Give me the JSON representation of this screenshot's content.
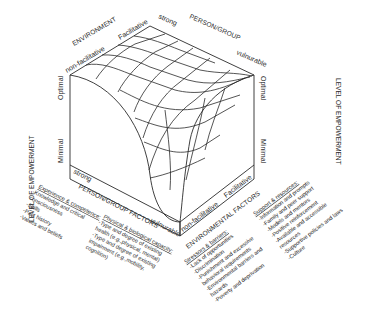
{
  "diagram": {
    "top_axes": {
      "environment": {
        "title": "ENVIRONMENT",
        "low": "non-facilitative",
        "high": "Facilitative"
      },
      "person_group": {
        "title": "PERSON/GROUP",
        "high": "strong",
        "low": "vulnurable"
      }
    },
    "vertical_axes": {
      "left": {
        "title": "LEVEL OF EMPOWERMENT",
        "high": "Optimal",
        "low": "Minimal"
      },
      "right": {
        "title": "LEVEL OF EMPOWERMENT",
        "high": "Optimal",
        "low": "Minimal"
      }
    },
    "base_axes": {
      "person_group_factors": {
        "title": "PERSON/GROUP FACTORS",
        "start": "strong",
        "end": "vulnurable"
      },
      "environmental_factors": {
        "title": "ENVIRONMENTAL FACTORS",
        "start": "non-facilitative",
        "end": "Facilitative"
      }
    },
    "factor_lists": {
      "experience": {
        "header": "Experience & competence:",
        "items": [
          "-Knowledge and critical",
          "consciousness",
          "-Skills",
          "-Past history",
          "-Values and beliefs"
        ]
      },
      "physical": {
        "header": "Physical & biological capacity:",
        "items": [
          "-Type and degree of existing",
          "health (e.g.,physical, mental)",
          "-Type and degree of existing",
          "impairment (e.g.,mobility,",
          "cognition)"
        ]
      },
      "stressors": {
        "header": "Stressors & barriers:",
        "items": [
          "-Lack of opportunities",
          "-Discrimination",
          "-Punishment and excessive",
          "behavioral requirements",
          "-Environmental barriers and",
          "hazards",
          "-Poverty and deprivation"
        ]
      },
      "support": {
        "header": "Support & resources:",
        "items": [
          "-Information and prompts",
          "-Family and peer support",
          "-Models and mentors",
          "-Positive reinforcement",
          "-Available and accessible",
          "resources",
          "-Supportive policies and laws",
          "-Culture"
        ]
      }
    }
  }
}
